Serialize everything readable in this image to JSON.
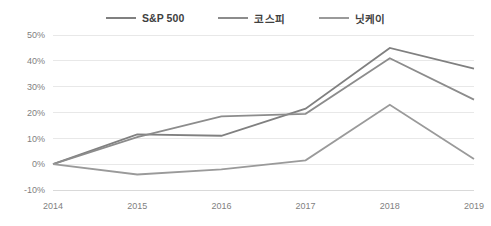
{
  "chart_data": {
    "type": "line",
    "title": "",
    "xlabel": "",
    "ylabel": "",
    "categories": [
      "2014",
      "2015",
      "2016",
      "2017",
      "2018",
      "2019"
    ],
    "x": [
      2014,
      2015,
      2016,
      2017,
      2018,
      2019
    ],
    "ylim": [
      -10,
      50
    ],
    "ytick_values": [
      50,
      40,
      30,
      20,
      10,
      0,
      -10
    ],
    "ytick_labels": [
      "50%",
      "40%",
      "30%",
      "20%",
      "10%",
      "0%",
      "-10%"
    ],
    "grid": true,
    "legend_position": "top-center",
    "series": [
      {
        "name": "S&P 500",
        "color": "#808080",
        "values": [
          0,
          11.5,
          11,
          21.5,
          45,
          37
        ]
      },
      {
        "name": "코스피",
        "color": "#8c8c8c",
        "values": [
          0,
          10.5,
          18.5,
          19.5,
          41,
          25
        ]
      },
      {
        "name": "닛케이",
        "color": "#9a9a9a",
        "values": [
          0,
          -4,
          -2,
          1.5,
          23,
          2
        ]
      }
    ]
  },
  "legend": {
    "items": [
      {
        "label": "S&P 500",
        "color": "#808080"
      },
      {
        "label": "코스피",
        "color": "#8c8c8c"
      },
      {
        "label": "닛케이",
        "color": "#9a9a9a"
      }
    ]
  },
  "axes": {
    "y_labels": [
      "50%",
      "40%",
      "30%",
      "20%",
      "10%",
      "0%",
      "-10%"
    ],
    "x_labels": [
      "2014",
      "2015",
      "2016",
      "2017",
      "2018",
      "2019"
    ]
  }
}
